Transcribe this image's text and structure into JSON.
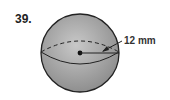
{
  "problem": {
    "number": "39."
  },
  "figure": {
    "shape": "sphere",
    "label": "12 mm",
    "measure": "radius",
    "fill_color": "#a9a9a9",
    "stroke_color": "#222222"
  }
}
